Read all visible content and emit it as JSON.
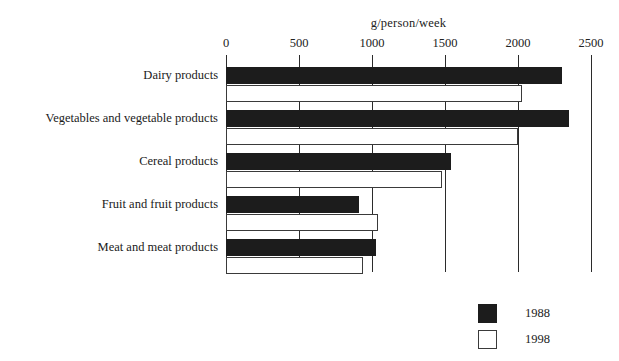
{
  "chart_data": {
    "type": "bar",
    "orientation": "horizontal",
    "title": "",
    "xlabel": "g/person/week",
    "ylabel": "",
    "xlim": [
      0,
      2500
    ],
    "xticks": [
      0,
      500,
      1000,
      1500,
      2000,
      2500
    ],
    "xticklabels": [
      "0",
      "500",
      "1000",
      "1500",
      "2000",
      "2500"
    ],
    "grid": true,
    "grid_axis": "x",
    "legend_position": "bottom-right",
    "categories": [
      "Dairy products",
      "Vegetables and vegetable products",
      "Cereal products",
      "Fruit and fruit products",
      "Meat and meat products"
    ],
    "series": [
      {
        "name": "1988",
        "color": "#1c1c1c",
        "fill": "solid",
        "values": [
          2300,
          2350,
          1540,
          910,
          1030
        ]
      },
      {
        "name": "1998",
        "color": "#ffffff",
        "fill": "hollow",
        "values": [
          2030,
          2000,
          1480,
          1040,
          940
        ]
      }
    ]
  },
  "legend": {
    "items": [
      {
        "label": "1988",
        "style": "filled"
      },
      {
        "label": "1998",
        "style": "hollow"
      }
    ]
  },
  "colors": {
    "series_1988": "#1c1c1c",
    "series_1998": "#ffffff",
    "axis": "#2b2b2b",
    "text": "#1a1a1a",
    "background": "#ffffff"
  }
}
